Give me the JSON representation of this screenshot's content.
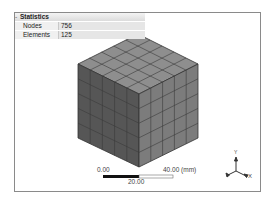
{
  "statistics": {
    "title": "Statistics",
    "rows": [
      {
        "label": "Nodes",
        "value": "756"
      },
      {
        "label": "Elements",
        "value": "125"
      }
    ]
  },
  "model": {
    "type": "hex mesh cube",
    "divisions": 5,
    "colors": {
      "top": "#8c8c8c",
      "left": "#555555",
      "right": "#7e7e7e",
      "edge": "#333333"
    }
  },
  "scale_bar": {
    "min": "0.00",
    "mid": "20.00",
    "max": "40.00 (mm)"
  },
  "triad": {
    "y": "Y",
    "x": "X",
    "z": "Z"
  }
}
